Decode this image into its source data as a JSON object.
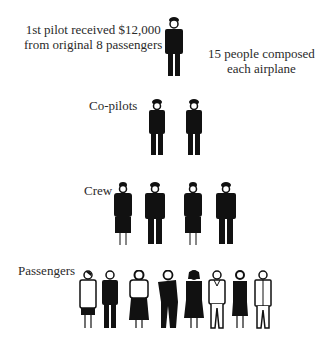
{
  "title_note": {
    "line1": "1st  pilot received $12,000",
    "line2": "from original 8 passengers"
  },
  "side_note": {
    "line1": "15 people composed",
    "line2": "each airplane"
  },
  "tiers": [
    {
      "label": "",
      "role": "pilot",
      "count": 1
    },
    {
      "label": "Co-pilots",
      "role": "co-pilot",
      "count": 2
    },
    {
      "label": "Crew",
      "role": "crew",
      "count": 4
    },
    {
      "label": "Passengers",
      "role": "passenger",
      "count": 8
    }
  ],
  "colors": {
    "ink": "#111111",
    "text": "#2a2a2a",
    "background": "#ffffff"
  }
}
